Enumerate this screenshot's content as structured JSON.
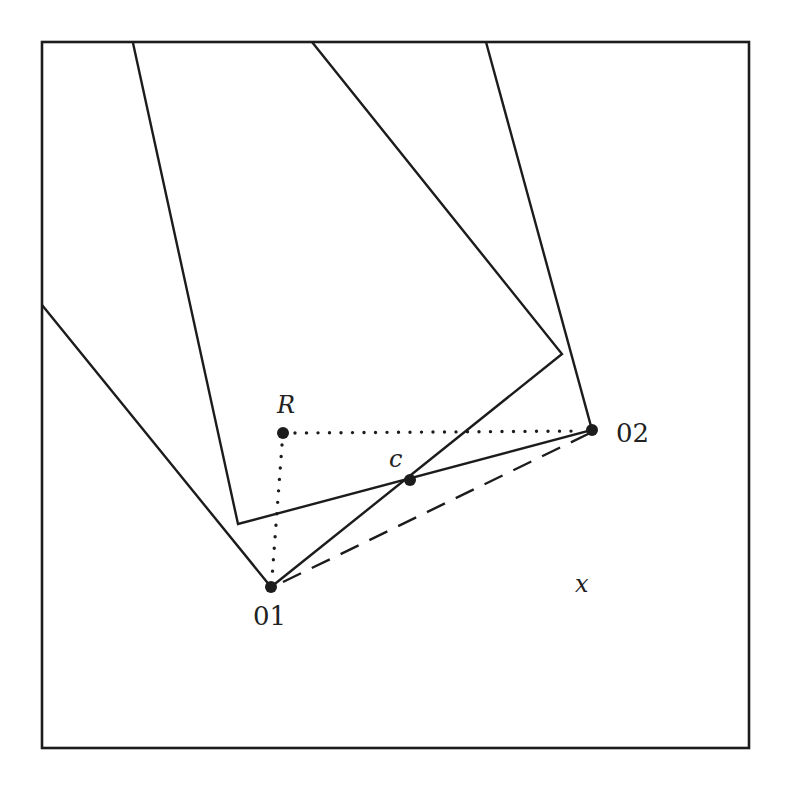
{
  "diagram": {
    "colors": {
      "ink": "#1c1c1c",
      "background": "#ffffff"
    },
    "labels": {
      "R": "R",
      "c": "c",
      "o1": "01",
      "o2": "02",
      "x": "x"
    },
    "points": {
      "R": [
        283,
        433
      ],
      "c": [
        410,
        480
      ],
      "o1": [
        271,
        587
      ],
      "o2": [
        592,
        430
      ]
    },
    "frame": {
      "x": 42,
      "y": 42,
      "width": 707,
      "height": 706
    },
    "rectangle_a": {
      "description": "Upright-ish rectangle with bottom edge from left corner to O2",
      "polyline": [
        [
          133,
          43
        ],
        [
          238,
          524
        ],
        [
          592,
          430
        ],
        [
          486,
          42
        ]
      ]
    },
    "rectangle_b": {
      "description": "Rectangle rotated ~40 degrees with bottom corner at O1",
      "polyline": [
        [
          42,
          305
        ],
        [
          271,
          587
        ],
        [
          562,
          354
        ],
        [
          312,
          42
        ]
      ]
    },
    "dotted_lines": [
      {
        "from": "R",
        "to": "o2"
      },
      {
        "from": "R",
        "to": "o1"
      }
    ],
    "dashed_lines": [
      {
        "from": "o1",
        "to": "o2"
      }
    ]
  }
}
